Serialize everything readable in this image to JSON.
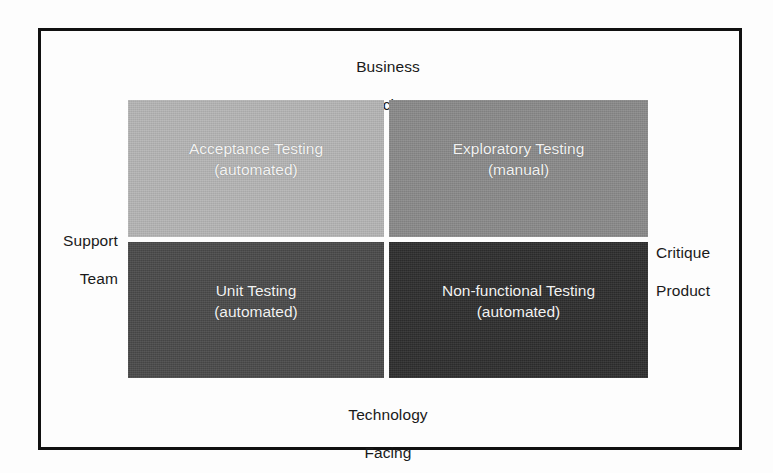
{
  "diagram": {
    "type": "agile-testing-quadrants",
    "axes": {
      "top": {
        "line1": "Business",
        "line2": "Facing"
      },
      "bottom": {
        "line1": "Technology",
        "line2": "Facing"
      },
      "left": {
        "line1": "Support",
        "line2": "Team"
      },
      "right": {
        "line1": "Critique",
        "line2": "Product"
      }
    },
    "quadrants": [
      {
        "id": "top-left",
        "title": "Acceptance Testing",
        "subtitle": "(automated)",
        "fill": "#b5b5b5",
        "text_color": "#f4f4f4"
      },
      {
        "id": "top-right",
        "title": "Exploratory Testing",
        "subtitle": "(manual)",
        "fill": "#8a8a8a",
        "text_color": "#f2f2f2"
      },
      {
        "id": "bottom-left",
        "title": "Unit Testing",
        "subtitle": "(automated)",
        "fill": "#4a4a4a",
        "text_color": "#f2f2f2"
      },
      {
        "id": "bottom-right",
        "title": "Non-functional Testing",
        "subtitle": "(automated)",
        "fill": "#2e2e2e",
        "text_color": "#f2f2f2"
      }
    ],
    "colors": {
      "frame": "#111111",
      "background": "#fdfdfd",
      "label_text": "#1a1a1a"
    }
  }
}
